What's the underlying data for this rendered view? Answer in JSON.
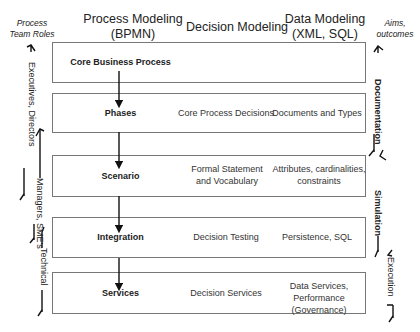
{
  "header": {
    "left_side": "Process Team Roles",
    "col1_line1": "Process Modeling",
    "col1_line2": "(BPMN)",
    "col2": "Decision Modeling",
    "col3_line1": "Data Modeling",
    "col3_line2": "(XML, SQL)",
    "right_side_line1": "Aims,",
    "right_side_line2": "outcomes"
  },
  "rows": [
    {
      "step": "Core Business Process",
      "decision": "",
      "data": ""
    },
    {
      "step": "Phases",
      "decision": "Core  Process Decisions",
      "data": "Documents and Types"
    },
    {
      "step": "Scenario",
      "decision": "Formal Statement and Vocabulary",
      "data": "Attributes, cardinalities, constraints"
    },
    {
      "step": "Integration",
      "decision": "Decision Testing",
      "data": "Persistence, SQL"
    },
    {
      "step": "Services",
      "decision": "Decision Services",
      "data": "Data Services, Performance (Governance)"
    }
  ],
  "roles": [
    {
      "label": "Executives, Directors"
    },
    {
      "label": "Managers, SME's"
    },
    {
      "label": "Technical"
    }
  ],
  "outcomes": [
    {
      "label": "Documentation"
    },
    {
      "label": "Simulation"
    },
    {
      "label": "Execution"
    }
  ],
  "colors": {
    "box_border": "#777777",
    "arrow": "#111111",
    "text": "#222222"
  }
}
